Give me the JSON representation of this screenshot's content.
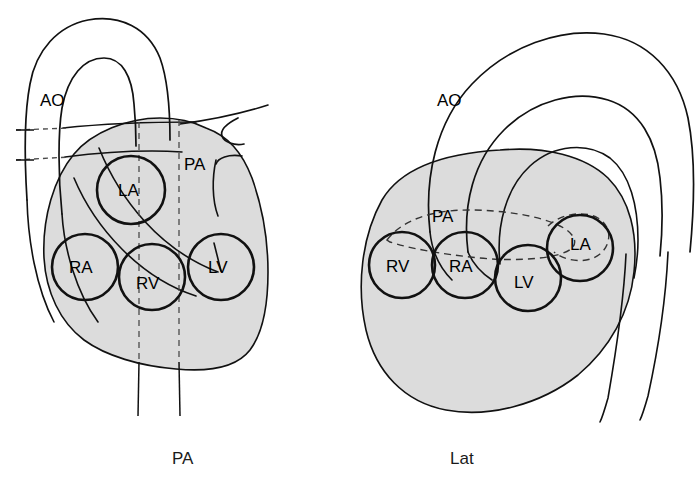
{
  "figure": {
    "stroke_color": "#111111",
    "fill_shade_color": "#dcdcdc",
    "background_color": "#ffffff",
    "dashed_color": "#4a4a4a"
  },
  "panels": [
    {
      "id": "pa-view",
      "caption": "PA",
      "caption_x": 186,
      "caption_y": 464,
      "vessel_labels": [
        {
          "name": "AO",
          "text": "AO",
          "x": 42,
          "y": 106
        },
        {
          "name": "PA",
          "text": "PA",
          "x": 186,
          "y": 170
        }
      ],
      "chambers": [
        {
          "name": "LA",
          "text": "LA",
          "cx": 131,
          "cy": 190,
          "r": 34,
          "label_x": 118,
          "label_y": 196
        },
        {
          "name": "RA",
          "text": "RA",
          "cx": 85,
          "cy": 267,
          "r": 33,
          "label_x": 71,
          "label_y": 273
        },
        {
          "name": "RV",
          "text": "RV",
          "cx": 152,
          "cy": 277,
          "r": 33,
          "label_x": 138,
          "label_y": 289
        },
        {
          "name": "LV",
          "text": "LV",
          "cx": 221,
          "cy": 267,
          "r": 33,
          "label_x": 209,
          "label_y": 273
        }
      ]
    },
    {
      "id": "lat-view",
      "caption": "Lat",
      "caption_x": 452,
      "caption_y": 464,
      "vessel_labels": [
        {
          "name": "AO",
          "text": "AO",
          "x": 438,
          "y": 106
        },
        {
          "name": "PA",
          "text": "PA",
          "x": 434,
          "y": 222
        }
      ],
      "chambers": [
        {
          "name": "RV",
          "text": "RV",
          "cx": 402,
          "cy": 265,
          "r": 33,
          "label_x": 388,
          "label_y": 271
        },
        {
          "name": "RA",
          "text": "RA",
          "cx": 465,
          "cy": 265,
          "r": 33,
          "label_x": 451,
          "label_y": 271
        },
        {
          "name": "LV",
          "text": "LV",
          "cx": 528,
          "cy": 278,
          "r": 33,
          "label_x": 516,
          "label_y": 286
        },
        {
          "name": "LA",
          "text": "LA",
          "cx": 580,
          "cy": 248,
          "r": 33,
          "label_x": 570,
          "label_y": 260
        }
      ]
    }
  ]
}
